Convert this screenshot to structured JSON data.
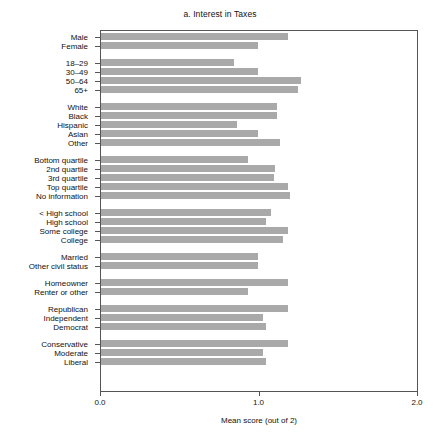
{
  "chart_data": {
    "type": "bar",
    "orientation": "horizontal",
    "title": "a. Interest in Taxes",
    "xlabel": "Mean score (out of 2)",
    "ylabel": "",
    "xlim": [
      0.0,
      2.0
    ],
    "xticks": [
      "0.0",
      "1.0",
      "2.0"
    ],
    "xtick_values": [
      0.0,
      1.0,
      2.0
    ],
    "grid": false,
    "legend": null,
    "bar_color": "#a9a9a9",
    "groups": [
      {
        "name": "gender",
        "categories": [
          "Male",
          "Female"
        ],
        "values": [
          1.18,
          0.99
        ]
      },
      {
        "name": "age",
        "categories": [
          "18–29",
          "30–49",
          "50–64",
          "65+"
        ],
        "values": [
          0.84,
          0.99,
          1.26,
          1.24
        ]
      },
      {
        "name": "race",
        "categories": [
          "White",
          "Black",
          "Hispanic",
          "Asian",
          "Other"
        ],
        "values": [
          1.11,
          1.11,
          0.86,
          0.99,
          1.13
        ]
      },
      {
        "name": "income",
        "categories": [
          "Bottom quartile",
          "2nd quartile",
          "3rd quartile",
          "Top quartile",
          "No information"
        ],
        "values": [
          0.93,
          1.1,
          1.09,
          1.18,
          1.19
        ]
      },
      {
        "name": "education",
        "categories": [
          "< High school",
          "High school",
          "Some college",
          "College"
        ],
        "values": [
          1.07,
          1.04,
          1.18,
          1.15
        ]
      },
      {
        "name": "marital-status",
        "categories": [
          "Married",
          "Other civil status"
        ],
        "values": [
          0.99,
          0.99
        ]
      },
      {
        "name": "housing",
        "categories": [
          "Homeowner",
          "Renter or other"
        ],
        "values": [
          1.18,
          0.93
        ]
      },
      {
        "name": "party",
        "categories": [
          "Republican",
          "Independent",
          "Democrat"
        ],
        "values": [
          1.18,
          1.02,
          1.04
        ]
      },
      {
        "name": "ideology",
        "categories": [
          "Conservative",
          "Moderate",
          "Liberal"
        ],
        "values": [
          1.18,
          1.02,
          1.04
        ]
      }
    ]
  }
}
